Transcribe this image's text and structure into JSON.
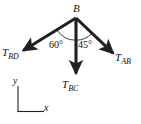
{
  "figure": {
    "type": "free-body-diagram",
    "background_color": "#ffffff",
    "stroke_color": "#231f20",
    "joint": {
      "label": "B",
      "x": 76,
      "y": 18
    },
    "forces": [
      {
        "name": "T_BD",
        "label_main": "T",
        "label_sub": "BD",
        "direction": "down-left",
        "tip_x": 20,
        "tip_y": 53,
        "angle_from_vertical_deg": 60
      },
      {
        "name": "T_BC",
        "label_main": "T",
        "label_sub": "BC",
        "direction": "down",
        "tip_x": 76,
        "tip_y": 79,
        "angle_from_vertical_deg": 0
      },
      {
        "name": "T_AB",
        "label_main": "T",
        "label_sub": "AB",
        "direction": "down-right",
        "tip_x": 117,
        "tip_y": 58,
        "angle_from_vertical_deg": 45
      }
    ],
    "angles": [
      {
        "name": "angle-left",
        "value": "60°",
        "between": "T_BD and T_BC"
      },
      {
        "name": "angle-right",
        "value": "45°",
        "between": "T_BC and T_AB"
      }
    ],
    "axes": {
      "x_label": "x",
      "y_label": "y",
      "origin_x": 18,
      "origin_y": 112,
      "y_top": 86,
      "x_right": 44
    }
  }
}
